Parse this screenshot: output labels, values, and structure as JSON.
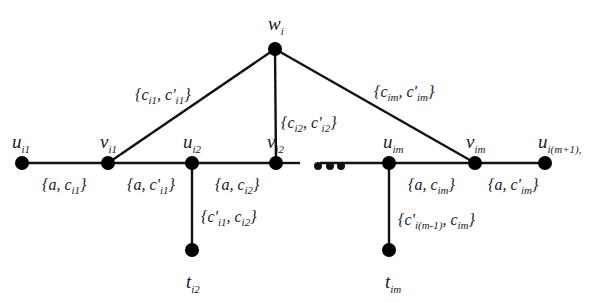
{
  "diagram": {
    "nodes": [
      {
        "id": "u_i1",
        "label": "u",
        "sub": "i1",
        "x": 22,
        "y": 163
      },
      {
        "id": "v_i1",
        "label": "v",
        "sub": "i1",
        "x": 108,
        "y": 163
      },
      {
        "id": "u_i2",
        "label": "u",
        "sub": "i2",
        "x": 192,
        "y": 163
      },
      {
        "id": "v_i2",
        "label": "v",
        "sub": "i2",
        "x": 276,
        "y": 163
      },
      {
        "id": "u_im",
        "label": "u",
        "sub": "im",
        "x": 389,
        "y": 163
      },
      {
        "id": "v_im",
        "label": "v",
        "sub": "im",
        "x": 475,
        "y": 163
      },
      {
        "id": "u_im1",
        "label": "u",
        "sub": "i(m+1),",
        "x": 545,
        "y": 163
      },
      {
        "id": "w_i",
        "label": "w",
        "sub": "i",
        "x": 275,
        "y": 49
      },
      {
        "id": "t_i2",
        "label": "t",
        "sub": "i2",
        "x": 192,
        "y": 250
      },
      {
        "id": "t_im",
        "label": "t",
        "sub": "im",
        "x": 389,
        "y": 250
      }
    ],
    "edge_labels": {
      "u_i1_v_i1": "{a, c_i1}",
      "v_i1_u_i2": "{a, c'_i1}",
      "u_i2_v_i2": "{a, c_i2}",
      "u_im_v_im": "{a, c_im}",
      "v_im_u_im1": "{a, c'_im}",
      "w_v_i1": "{c_i1, c'_i1}",
      "w_v_i2": "{c_i2, c'_i2}",
      "w_v_im": "{c_im, c'_im}",
      "u_i2_t_i2": "{c'_i1, c_i2}",
      "u_im_t_im": "{c'_i(m-1), c_im}"
    },
    "ellipsis": "..."
  },
  "text": {
    "set_open": "{",
    "set_close": "}",
    "a": "a",
    "c": "c",
    "cprime": "c'",
    "comma": ", ",
    "u": "u",
    "v": "v",
    "w": "w",
    "t": "t",
    "s_i1": "i1",
    "s_i2": "i2",
    "s_im": "im",
    "s_i": "i",
    "s_im1": "i(m+1),",
    "s_im_minus1": "i(m-1)"
  }
}
